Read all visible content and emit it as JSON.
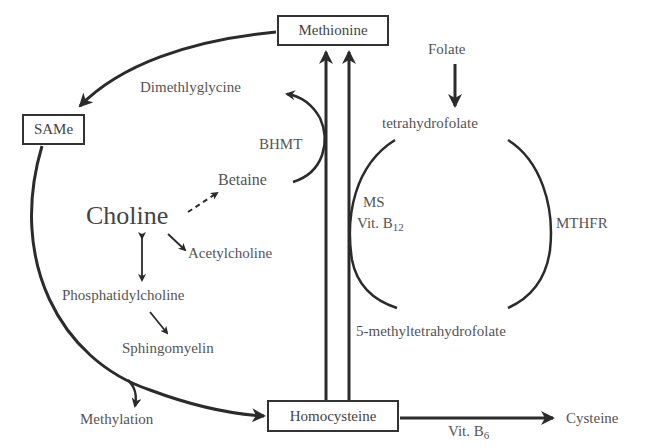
{
  "diagram": {
    "nodes": {
      "methionine": "Methionine",
      "same": "SAMe",
      "homocysteine": "Homocysteine",
      "cysteine": "Cysteine",
      "folate": "Folate",
      "tetrahydrofolate": "tetrahydrofolate",
      "methyltetrahydrofolate": "5-methyltetrahydrofolate",
      "dimethylglycine": "Dimethlyglycine",
      "betaine": "Betaine",
      "choline": "Choline",
      "acetylcholine": "Acetylcholine",
      "phosphatidylcholine": "Phosphatidylcholine",
      "sphingomyelin": "Sphingomyelin",
      "methylation": "Methylation"
    },
    "enzymes": {
      "bhmt": "BHMT",
      "ms": "MS",
      "vitb12_prefix": "Vit. B",
      "vitb12_sub": "12",
      "mthfr": "MTHFR",
      "vitb6_prefix": "Vit. B",
      "vitb6_sub": "6"
    },
    "colors": {
      "line": "#2b2b2b",
      "text": "#555555",
      "box_border": "#333333"
    }
  }
}
